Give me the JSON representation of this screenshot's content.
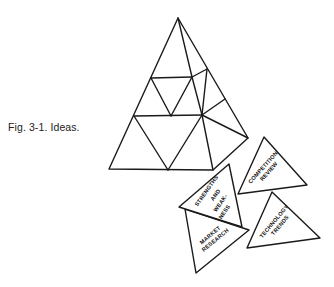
{
  "caption": "Fig. 3-1. Ideas.",
  "colors": {
    "ink": "#1a1a1a",
    "background": "#ffffff"
  },
  "main_figure": {
    "description": "Large triangle subdivided into smaller triangular pieces"
  },
  "pieces": [
    {
      "id": "strengths",
      "lines": [
        "STRENGTHS",
        "AND",
        "WEAK-",
        "NESS"
      ]
    },
    {
      "id": "market",
      "lines": [
        "MARKET",
        "RESEARCH"
      ]
    },
    {
      "id": "competition",
      "lines": [
        "COMPETITION",
        "REVIEW"
      ]
    },
    {
      "id": "technology",
      "lines": [
        "TECHNOLOGY",
        "TRENDS"
      ]
    }
  ]
}
